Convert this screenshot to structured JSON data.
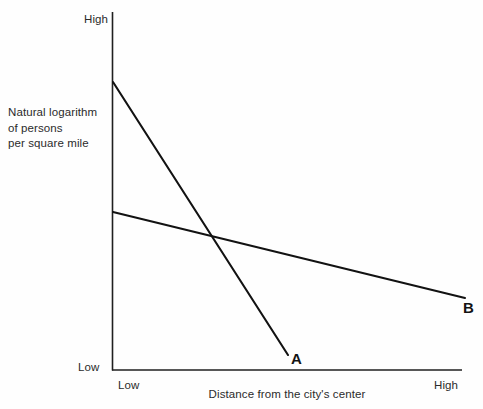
{
  "chart_data": {
    "type": "line",
    "title": "",
    "subtitle": "",
    "xlabel": "Distance from the city's center",
    "ylabel": "Natural logarithm of persons per square mile",
    "ylabel_lines": [
      "Natural logarithm",
      "of persons",
      "per square mile"
    ],
    "xtick_labels": [
      "Low",
      "High"
    ],
    "ytick_labels": [
      "Low",
      "High"
    ],
    "xlim": [
      0,
      1
    ],
    "ylim": [
      0,
      1
    ],
    "grid": false,
    "legend": "none (series labeled at line ends)",
    "axis_color": "#1f1f1f",
    "line_color": "#121212",
    "background_color": "#fefefe",
    "series": [
      {
        "name": "A",
        "label": "A",
        "label_position": "end-of-line",
        "description": "steep negative slope, ends before right edge of plot",
        "points": [
          {
            "x": 0.003,
            "y": 0.805
          },
          {
            "x": 0.503,
            "y": 0.042
          }
        ],
        "pixel_points": [
          {
            "x": 113,
            "y": 82
          },
          {
            "x": 288,
            "y": 355
          }
        ]
      },
      {
        "name": "B",
        "label": "B",
        "label_position": "end-of-line",
        "description": "shallow negative slope, spans full plot width",
        "points": [
          {
            "x": 0.003,
            "y": 0.441
          },
          {
            "x": 1.009,
            "y": 0.201
          }
        ],
        "pixel_points": [
          {
            "x": 113,
            "y": 212
          },
          {
            "x": 465,
            "y": 298
          }
        ]
      }
    ],
    "intersection": {
      "x": 0.289,
      "y": 0.369,
      "pixel": {
        "x": 213,
        "y": 238
      }
    },
    "annotations": []
  },
  "axes": {
    "y_title_line1": "Natural logarithm",
    "y_title_line2": "of persons",
    "y_title_line3": "per square mile",
    "x_title": "Distance from the city's center",
    "y_tick_high": "High",
    "y_tick_low": "Low",
    "x_tick_low": "Low",
    "x_tick_high": "High"
  },
  "series_labels": {
    "a": "A",
    "b": "B"
  }
}
